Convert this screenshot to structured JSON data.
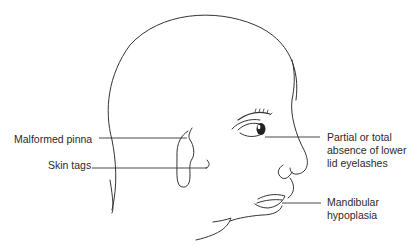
{
  "figure": {
    "labels": {
      "malformed_pinna": "Malformed pinna",
      "skin_tags": "Skin tags",
      "eyelashes": "Partial or total\nabsence of lower\nlid eyelashes",
      "mandibular": "Mandibular\nhypoplasia"
    },
    "colors": {
      "line": "#333333",
      "text": "#2a2a2a",
      "background": "#ffffff"
    }
  }
}
